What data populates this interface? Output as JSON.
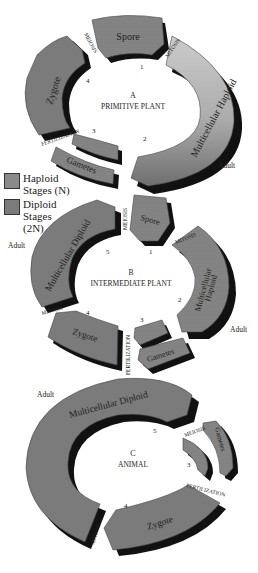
{
  "colors": {
    "haploid": "#8a8a8a",
    "haploid_light": "#cfcfcf",
    "diploid": "#7b7b7b",
    "shadow": "#111111",
    "text": "#222222"
  },
  "legend": {
    "items": [
      {
        "key": "haploid",
        "label_line1": "Haploid",
        "label_line2": "Stages (N)"
      },
      {
        "key": "diploid",
        "label_line1": "Diploid",
        "label_line2": "Stages",
        "label_line3": "(2N)"
      }
    ]
  },
  "cycles": [
    {
      "id": "A",
      "letter": "A",
      "title": "PRIMITIVE PLANT",
      "segments": {
        "spore": "Spore",
        "multicellular": "Multicellular Haploid",
        "gametes": "Gametes",
        "zygote": "Zygote"
      },
      "processes": {
        "meiosis": "MEIOSIS",
        "mitosis": "MITOSIS",
        "fertilization": "FERTILIZATION"
      },
      "numbers": [
        "1",
        "2",
        "3",
        "4"
      ],
      "adult_label": "Adult"
    },
    {
      "id": "B",
      "letter": "B",
      "title": "INTERMEDIATE PLANT",
      "segments": {
        "spore": "Spore",
        "multicellular_haploid_1": "Multicellular",
        "multicellular_haploid_2": "Haploid",
        "gametes": "Gametes",
        "zygote": "Zygote",
        "multicellular_diploid": "Multicellular Diploid"
      },
      "processes": {
        "meiosis": "MEIOSIS",
        "mitosis_top": "MITOSIS",
        "mitosis_left": "MITOSIS",
        "fertilization": "FERTILIZATION"
      },
      "numbers": [
        "1",
        "2",
        "3",
        "4",
        "5"
      ],
      "adult_label_right": "Adult",
      "adult_label_left": "Adult"
    },
    {
      "id": "C",
      "letter": "C",
      "title": "ANIMAL",
      "segments": {
        "multicellular_diploid": "Multicellular Diploid",
        "gametes": "Gametes",
        "zygote": "Zygote"
      },
      "processes": {
        "meiosis": "MEIOSIS",
        "mitosis": "MITOSIS",
        "fertilization": "FERTILIZATION"
      },
      "numbers": [
        "3",
        "4",
        "5"
      ],
      "adult_label": "Adult"
    }
  ]
}
